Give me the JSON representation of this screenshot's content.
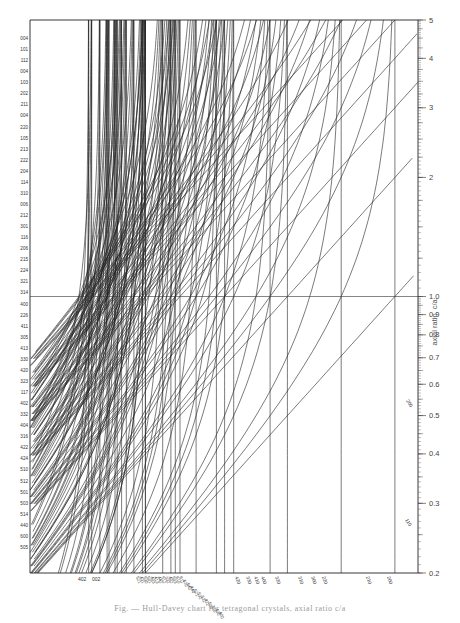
{
  "chart_data": {
    "type": "line",
    "title": "",
    "subtitle": "Hull-Davey chart (tetragonal)",
    "xlabel": "",
    "ylabel": "axial ratio, c/a",
    "y_scale": "log",
    "ylim": [
      0.2,
      5
    ],
    "y_ticks": [
      {
        "value": 5,
        "label": "5"
      },
      {
        "value": 4,
        "label": "4"
      },
      {
        "value": 3,
        "label": "3"
      },
      {
        "value": 2,
        "label": "2"
      },
      {
        "value": 1.0,
        "label": "1.0"
      },
      {
        "value": 0.9,
        "label": "0.9"
      },
      {
        "value": 0.8,
        "label": "0.8"
      },
      {
        "value": 0.7,
        "label": "0.7"
      },
      {
        "value": 0.6,
        "label": "0.6"
      },
      {
        "value": 0.5,
        "label": "0.5"
      },
      {
        "value": 0.4,
        "label": "0.4"
      },
      {
        "value": 0.3,
        "label": "0.3"
      },
      {
        "value": 0.2,
        "label": "0.2"
      }
    ],
    "grid": false,
    "reference_line": {
      "y": 1.0
    },
    "left_labels": [
      "004",
      "101",
      "112",
      "004",
      "103",
      "202",
      "211",
      "004",
      "220",
      "105",
      "213",
      "222",
      "204",
      "114",
      "310",
      "006",
      "212",
      "301",
      "116",
      "206",
      "215",
      "224",
      "321",
      "314",
      "400",
      "226",
      "411",
      "305",
      "413",
      "330",
      "420",
      "323",
      "117",
      "402",
      "332",
      "404",
      "316",
      "422",
      "424",
      "510",
      "512",
      "501",
      "503",
      "514",
      "440",
      "600",
      "505"
    ],
    "bottom_labels_left": [
      "402",
      "002"
    ],
    "bottom_labels_center": [
      "521",
      "431",
      "530",
      "501",
      "403",
      "413",
      "442",
      "512",
      "332",
      "402",
      "503",
      "610",
      "611",
      "620",
      "540",
      "440",
      "521",
      "532",
      "531",
      "422",
      "500",
      "310",
      "430",
      "400"
    ],
    "bottom_labels_right": [
      "420",
      "330",
      "410",
      "400",
      "320",
      "310",
      "300",
      "220",
      "210",
      "200"
    ],
    "diagonal_labels": [
      {
        "text": "200",
        "y_value": 0.52
      },
      {
        "text": "110",
        "y_value": 0.26
      }
    ],
    "series_note": "Each curve represents log d-spacing for an (hkl) plane versus c/a; labels indicate hkl indices."
  },
  "caption": "Fig. — Hull-Davey chart for tetragonal crystals, axial ratio c/a"
}
